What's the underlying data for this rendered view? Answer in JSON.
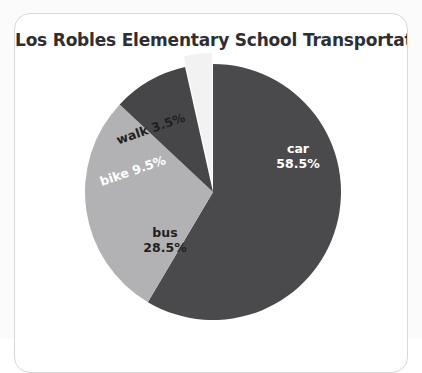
{
  "card": {
    "title": "Los Robles Elementary School Transportation"
  },
  "chart_data": {
    "type": "pie",
    "title": "Los Robles Elementary School Transportation",
    "xlabel": "",
    "ylabel": "",
    "legend": "none",
    "grid": false,
    "start_angle_deg": 0,
    "direction": "clockwise",
    "categories": [
      "car",
      "bus",
      "bike",
      "walk"
    ],
    "values": [
      58.5,
      28.5,
      9.5,
      3.5
    ],
    "value_unit": "%",
    "colors": [
      "#4a4a4d",
      "#b2b2b4",
      "#464649",
      "#f2f2f2"
    ],
    "exploded": [
      "walk"
    ],
    "slices": [
      {
        "name": "car",
        "value": 58.5,
        "label_name": "car",
        "label_value": "58.5%",
        "color": "#4a4a4d",
        "label_color": "#ffffff",
        "exploded": false
      },
      {
        "name": "bus",
        "value": 28.5,
        "label_name": "bus",
        "label_value": "28.5%",
        "color": "#b2b2b4",
        "label_color": "#1f1f22",
        "exploded": false
      },
      {
        "name": "bike",
        "value": 9.5,
        "label_name": "bike",
        "label_value": "9.5%",
        "color": "#464649",
        "label_color": "#ffffff",
        "exploded": false
      },
      {
        "name": "walk",
        "value": 3.5,
        "label_name": "walk",
        "label_value": "3.5%",
        "color": "#f2f2f2",
        "label_color": "#1f1f22",
        "exploded": true
      }
    ]
  }
}
